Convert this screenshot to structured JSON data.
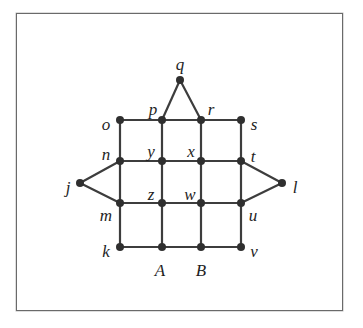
{
  "diagram": {
    "type": "graph",
    "frame": {
      "x": 16,
      "y": 13,
      "width": 327,
      "height": 298
    },
    "nodes": [
      {
        "id": "q",
        "label": "q",
        "x": 180,
        "y": 80,
        "lx": 180,
        "ly": 66,
        "anchor": "middle"
      },
      {
        "id": "o",
        "label": "o",
        "x": 120,
        "y": 120,
        "lx": 106,
        "ly": 126,
        "anchor": "middle"
      },
      {
        "id": "p",
        "label": "p",
        "x": 162,
        "y": 120,
        "lx": 153,
        "ly": 111,
        "anchor": "middle"
      },
      {
        "id": "r",
        "label": "r",
        "x": 201,
        "y": 120,
        "lx": 211,
        "ly": 111,
        "anchor": "middle"
      },
      {
        "id": "s",
        "label": "s",
        "x": 241,
        "y": 120,
        "lx": 254,
        "ly": 126,
        "anchor": "middle"
      },
      {
        "id": "n",
        "label": "n",
        "x": 120,
        "y": 161,
        "lx": 106,
        "ly": 156,
        "anchor": "middle"
      },
      {
        "id": "y",
        "label": "y",
        "x": 162,
        "y": 161,
        "lx": 151,
        "ly": 153,
        "anchor": "middle"
      },
      {
        "id": "x",
        "label": "x",
        "x": 201,
        "y": 161,
        "lx": 191,
        "ly": 153,
        "anchor": "middle"
      },
      {
        "id": "t",
        "label": "t",
        "x": 241,
        "y": 161,
        "lx": 253,
        "ly": 158,
        "anchor": "middle"
      },
      {
        "id": "j",
        "label": "j",
        "x": 80,
        "y": 183,
        "lx": 68,
        "ly": 189,
        "anchor": "middle"
      },
      {
        "id": "l",
        "label": "l",
        "x": 282,
        "y": 183,
        "lx": 295,
        "ly": 189,
        "anchor": "middle"
      },
      {
        "id": "z",
        "label": "z",
        "x": 162,
        "y": 203,
        "lx": 151,
        "ly": 196,
        "anchor": "middle"
      },
      {
        "id": "w",
        "label": "w",
        "x": 201,
        "y": 203,
        "lx": 190,
        "ly": 196,
        "anchor": "middle"
      },
      {
        "id": "m",
        "label": "m",
        "x": 120,
        "y": 203,
        "lx": 106,
        "ly": 217,
        "anchor": "middle"
      },
      {
        "id": "u",
        "label": "u",
        "x": 241,
        "y": 203,
        "lx": 253,
        "ly": 217,
        "anchor": "middle"
      },
      {
        "id": "k",
        "label": "k",
        "x": 120,
        "y": 247,
        "lx": 106,
        "ly": 253,
        "anchor": "middle"
      },
      {
        "id": "A",
        "label": "A",
        "x": 162,
        "y": 247,
        "lx": 160,
        "ly": 272,
        "anchor": "middle"
      },
      {
        "id": "B",
        "label": "B",
        "x": 201,
        "y": 247,
        "lx": 201,
        "ly": 272,
        "anchor": "middle"
      },
      {
        "id": "v",
        "label": "v",
        "x": 241,
        "y": 247,
        "lx": 254,
        "ly": 253,
        "anchor": "middle"
      }
    ],
    "edges": [
      [
        "o",
        "p"
      ],
      [
        "p",
        "r"
      ],
      [
        "r",
        "s"
      ],
      [
        "p",
        "q"
      ],
      [
        "q",
        "r"
      ],
      [
        "n",
        "y"
      ],
      [
        "y",
        "x"
      ],
      [
        "x",
        "t"
      ],
      [
        "m",
        "z"
      ],
      [
        "z",
        "w"
      ],
      [
        "w",
        "u"
      ],
      [
        "k",
        "A"
      ],
      [
        "A",
        "B"
      ],
      [
        "B",
        "v"
      ],
      [
        "o",
        "n"
      ],
      [
        "n",
        "m"
      ],
      [
        "m",
        "k"
      ],
      [
        "p",
        "y"
      ],
      [
        "y",
        "z"
      ],
      [
        "z",
        "A"
      ],
      [
        "r",
        "x"
      ],
      [
        "x",
        "w"
      ],
      [
        "w",
        "B"
      ],
      [
        "s",
        "t"
      ],
      [
        "t",
        "u"
      ],
      [
        "u",
        "v"
      ],
      [
        "j",
        "n"
      ],
      [
        "j",
        "m"
      ],
      [
        "l",
        "t"
      ],
      [
        "l",
        "u"
      ]
    ],
    "style": {
      "edge_color": "#3d3d3d",
      "node_color": "#2f2f2f",
      "label_color": "#1e1e1e",
      "frame_color": "#6a6a6a",
      "node_radius": 4
    }
  }
}
